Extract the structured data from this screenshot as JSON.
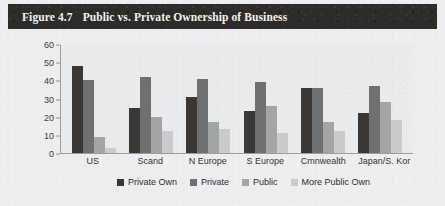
{
  "figure": {
    "number_label": "Figure 4.7",
    "title": "Public vs. Private Ownership of Business"
  },
  "colors": {
    "series_private_own": "#3a3734",
    "series_private": "#6e7174",
    "series_public": "#a3a6a9",
    "series_more_public_own": "#c9cbcd",
    "title_bar_bg": "#2e2b29",
    "title_text": "#f3f2ef",
    "panel_bg": "#e9ebee",
    "page_bg": "#eceef1",
    "axis_line": "#9a9ea3",
    "tick_text": "#3c3c3c"
  },
  "chart_data": {
    "type": "bar",
    "title": "Public vs. Private Ownership of Business",
    "xlabel": "",
    "ylabel": "",
    "ylim": [
      0,
      60
    ],
    "yticks": [
      0,
      10,
      20,
      30,
      40,
      50,
      60
    ],
    "grid": false,
    "legend_position": "bottom",
    "categories": [
      "US",
      "Scand",
      "N Europe",
      "S Europe",
      "Cmnwealth",
      "Japan/S. Kor"
    ],
    "series": [
      {
        "name": "Private Own",
        "values": [
          48,
          25,
          31,
          23,
          36,
          22
        ]
      },
      {
        "name": "Private",
        "values": [
          40,
          42,
          41,
          39,
          36,
          37
        ]
      },
      {
        "name": "Public",
        "values": [
          9,
          20,
          17,
          26,
          17,
          28
        ]
      },
      {
        "name": "More Public Own",
        "values": [
          3,
          12,
          13,
          11,
          12,
          18
        ]
      }
    ]
  },
  "legend": {
    "entries": [
      {
        "label": "Private Own"
      },
      {
        "label": "Private"
      },
      {
        "label": "Public"
      },
      {
        "label": "More Public Own"
      }
    ]
  }
}
